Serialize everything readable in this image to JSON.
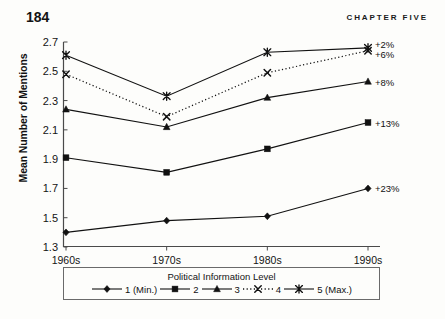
{
  "page": {
    "folio": "184",
    "running_head": "CHAPTER FIVE"
  },
  "chart_data": {
    "type": "line",
    "title": "",
    "xlabel": "",
    "ylabel": "Mean Number of Mentions",
    "categories": [
      "1960s",
      "1970s",
      "1980s",
      "1990s"
    ],
    "ylim": [
      1.3,
      2.7
    ],
    "ytick_labels": [
      "2.7",
      "2.5",
      "2.3",
      "2.1",
      "1.9",
      "1.7",
      "1.5",
      "1.3"
    ],
    "yticks": [
      2.7,
      2.5,
      2.3,
      2.1,
      1.9,
      1.7,
      1.5,
      1.3
    ],
    "grid": false,
    "legend_position": "bottom",
    "legend_title": "Political Information Level",
    "series": [
      {
        "name": "1 (Min.)",
        "marker": "diamond-marker",
        "linestyle": "solid",
        "color": "#111111",
        "values": [
          1.4,
          1.48,
          1.51,
          1.7
        ],
        "end_label": "+23%"
      },
      {
        "name": "2",
        "marker": "square-marker",
        "linestyle": "solid",
        "color": "#111111",
        "values": [
          1.91,
          1.81,
          1.97,
          2.15
        ],
        "end_label": "+13%"
      },
      {
        "name": "3",
        "marker": "triangle-marker",
        "linestyle": "solid",
        "color": "#111111",
        "values": [
          2.24,
          2.12,
          2.32,
          2.43
        ],
        "end_label": "+8%"
      },
      {
        "name": "4",
        "marker": "cross-marker",
        "linestyle": "dotted",
        "color": "#111111",
        "values": [
          2.48,
          2.19,
          2.49,
          2.64
        ],
        "end_label": "+6%"
      },
      {
        "name": "5 (Max.)",
        "marker": "asterisk-marker",
        "linestyle": "solid",
        "color": "#111111",
        "values": [
          2.61,
          2.33,
          2.63,
          2.66
        ],
        "end_label": "+2%"
      }
    ]
  }
}
